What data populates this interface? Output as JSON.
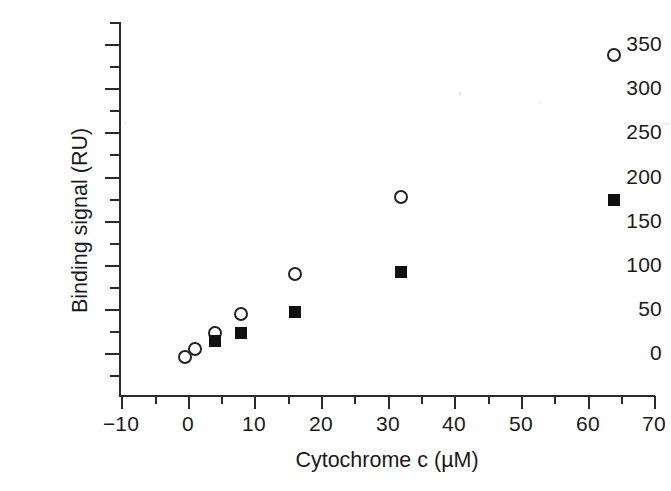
{
  "chart_data": {
    "type": "scatter",
    "title": "",
    "xlabel": "Cytochrome c (µM)",
    "ylabel": "Binding signal (RU)",
    "xlim": [
      -10,
      70
    ],
    "ylim": [
      -25,
      370
    ],
    "xticks": [
      -10,
      0,
      10,
      20,
      30,
      40,
      50,
      60,
      70
    ],
    "xticklabels": [
      "−10",
      "0",
      "10",
      "20",
      "30",
      "40",
      "50",
      "60",
      "70"
    ],
    "yticks": [
      0,
      50,
      100,
      150,
      200,
      250,
      300,
      350
    ],
    "yticklabels": [
      "0",
      "50",
      "100",
      "150",
      "200",
      "250",
      "300",
      "350"
    ],
    "x_minor_ticks": [
      -5,
      5,
      15,
      25,
      35,
      45,
      55,
      65
    ],
    "y_minor_ticks": [
      -25,
      25,
      75,
      125,
      175,
      225,
      275,
      325
    ],
    "grid": false,
    "legend": "none",
    "series": [
      {
        "name": "open-circle-series",
        "marker": "open-circle",
        "color": "#222222",
        "points": [
          {
            "x": -0.4,
            "y": -5
          },
          {
            "x": 1.0,
            "y": 5
          },
          {
            "x": 4.0,
            "y": 23
          },
          {
            "x": 8.0,
            "y": 44
          },
          {
            "x": 16.0,
            "y": 89
          },
          {
            "x": 32.0,
            "y": 177
          },
          {
            "x": 64.0,
            "y": 337
          }
        ]
      },
      {
        "name": "filled-square-series",
        "marker": "filled-square",
        "color": "#101010",
        "points": [
          {
            "x": 4.0,
            "y": 14
          },
          {
            "x": 8.0,
            "y": 23
          },
          {
            "x": 16.0,
            "y": 46
          },
          {
            "x": 32.0,
            "y": 92
          },
          {
            "x": 64.0,
            "y": 173
          }
        ]
      }
    ]
  },
  "axes": {
    "x_title": "Cytochrome c (µM)",
    "y_title": "Binding signal (RU)",
    "x_tick_labels": [
      "−10",
      "0",
      "10",
      "20",
      "30",
      "40",
      "50",
      "60",
      "70"
    ],
    "y_tick_labels": [
      "350",
      "300",
      "250",
      "200",
      "150",
      "100",
      "50",
      "0"
    ],
    "axis_color": "#2b2b2b"
  },
  "figure": {
    "background": "#ffffff"
  }
}
